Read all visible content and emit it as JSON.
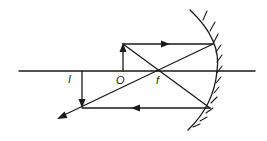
{
  "diagram": {
    "colors": {
      "ink": "#1a1a1a",
      "background": "#ffffff"
    },
    "labels": {
      "image": "I",
      "object": "O",
      "focal_point": "f"
    },
    "elements": {
      "principal_axis": {
        "x1": 19,
        "y1": 71,
        "x2": 255,
        "y2": 71
      },
      "object_arrow": {
        "x": 123,
        "base_y": 71,
        "tip_y": 44,
        "direction": "up"
      },
      "image_arrow": {
        "x": 82,
        "base_y": 71,
        "tip_y": 108,
        "direction": "down"
      },
      "focal_point": {
        "x": 160,
        "y": 71
      },
      "mirror": {
        "type": "concave",
        "side": "right",
        "hatched": true
      },
      "rays": [
        {
          "name": "parallel-incident",
          "from": [
            123,
            44
          ],
          "to": [
            213,
            44
          ]
        },
        {
          "name": "reflected-through-focus",
          "from": [
            213,
            44
          ],
          "to": [
            58,
            118
          ]
        },
        {
          "name": "incident-through-focus",
          "from": [
            123,
            44
          ],
          "to": [
            210,
            108
          ]
        },
        {
          "name": "reflected-parallel",
          "from": [
            210,
            108
          ],
          "to": [
            82,
            108
          ]
        }
      ]
    }
  }
}
